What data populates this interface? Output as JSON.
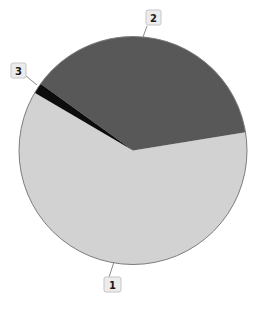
{
  "chart_data": {
    "type": "pie",
    "labels": [
      "1",
      "2",
      "3"
    ],
    "values": [
      61,
      37.5,
      1.5
    ],
    "unit": "percent",
    "colors": [
      "#d2d2d2",
      "#585858",
      "#0d0d0d"
    ],
    "start_angle": 149.6,
    "direction": "counterclockwise",
    "title": "",
    "legend": "none",
    "label_style": "boxed-numbers-with-leader-lines",
    "outline_color": "#7d7d7d",
    "leader_line_color": "#8a8a8a",
    "label_box_fill": "#ececec",
    "label_box_border": "#c6c6c6",
    "label_text_color": "#1a1a1a",
    "background": "#ffffff"
  }
}
